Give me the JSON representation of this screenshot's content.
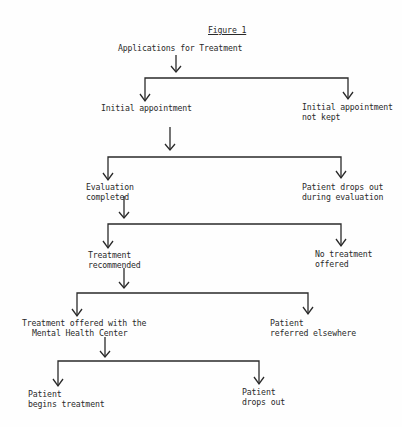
{
  "figure": {
    "title": "Figure 1",
    "root": "Applications for Treatment",
    "levels": [
      {
        "left": [
          "Initial appointment"
        ],
        "right": [
          "Initial appointment",
          "not kept"
        ]
      },
      {
        "left": [
          "Evaluation",
          "completed"
        ],
        "right": [
          "Patient drops out",
          "during evaluation"
        ]
      },
      {
        "left": [
          "Treatment",
          "recommended"
        ],
        "right": [
          "No treatment",
          "offered"
        ]
      },
      {
        "left": [
          "Treatment offered with the",
          "Mental Health Center"
        ],
        "right": [
          "Patient",
          "referred elsewhere"
        ]
      },
      {
        "left": [
          "Patient",
          "begins treatment"
        ],
        "right": [
          "Patient",
          "drops out"
        ]
      }
    ]
  },
  "colors": {
    "ink": "#2a2a2a",
    "paper": "#fefefe"
  }
}
